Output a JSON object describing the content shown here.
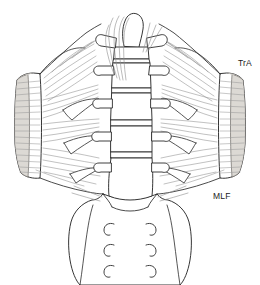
{
  "figure": {
    "background_color": "#ffffff",
    "line_color": "#2b2b2b",
    "fiber_color": "#8d8d8d",
    "shade_color": "#d6d2cc"
  },
  "labels": {
    "tra": "TrA",
    "mlf": "MLF"
  },
  "anatomy": {
    "vertebrae_count": 5,
    "spinous_process_label": "spinous-process",
    "sacral_foramina_pairs": 3,
    "muscle_left": "transversus-abdominis-left",
    "muscle_right": "transversus-abdominis-right",
    "fascia": "middle-layer-thoracolumbar-fascia",
    "sacrum": "sacrum"
  }
}
